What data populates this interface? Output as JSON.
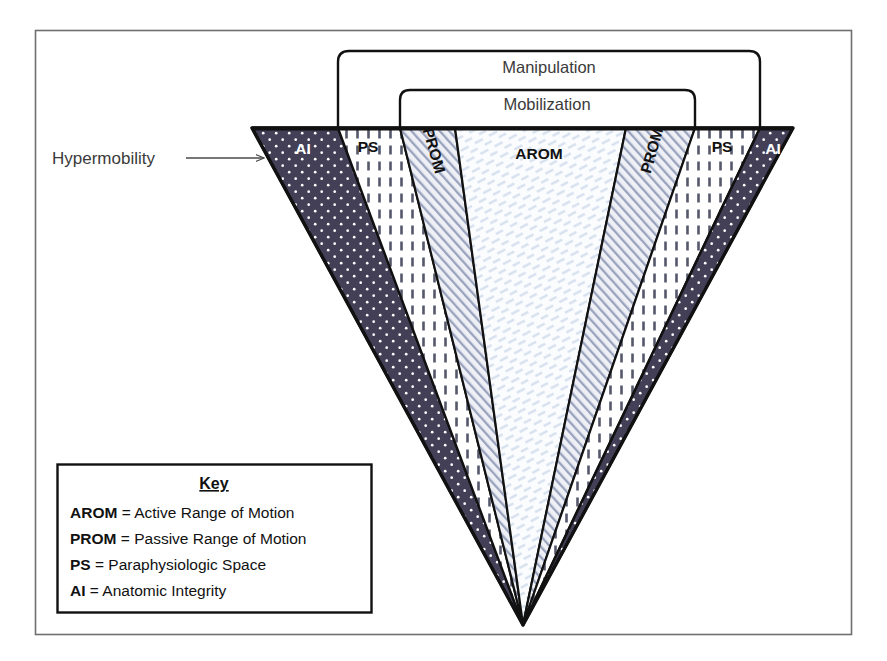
{
  "figure": {
    "title_text": "",
    "hypermobility_label": "Hypermobility",
    "brackets": [
      {
        "id": "manipulation",
        "label": "Manipulation"
      },
      {
        "id": "mobilization",
        "label": "Mobilization"
      }
    ],
    "bands": [
      {
        "id": "ai-left",
        "label": "AI",
        "side": "left",
        "fill": "#423f57",
        "text_color": "#ffffff"
      },
      {
        "id": "ps-left",
        "label": "PS",
        "side": "left",
        "fill": "#ffffff",
        "text_color": "#111111"
      },
      {
        "id": "prom-left",
        "label": "PROM",
        "side": "left",
        "fill": "#eef0f6",
        "text_color": "#111111"
      },
      {
        "id": "arom",
        "label": "AROM",
        "side": "center",
        "fill": "#f7f9fc",
        "text_color": "#111111"
      },
      {
        "id": "prom-right",
        "label": "PROM",
        "side": "right",
        "fill": "#eef0f6",
        "text_color": "#111111"
      },
      {
        "id": "ps-right",
        "label": "PS",
        "side": "right",
        "fill": "#ffffff",
        "text_color": "#111111"
      },
      {
        "id": "ai-right",
        "label": "AI",
        "side": "right",
        "fill": "#423f57",
        "text_color": "#ffffff"
      }
    ]
  },
  "key": {
    "title": "Key",
    "entries": [
      {
        "abbr": "AROM",
        "sep": " = ",
        "definition": "Active Range of Motion"
      },
      {
        "abbr": "PROM",
        "sep": " = ",
        "definition": "Passive Range of Motion"
      },
      {
        "abbr": "PS",
        "sep": " = ",
        "definition": "Paraphysiologic Space"
      },
      {
        "abbr": "AI",
        "sep": " = ",
        "definition": "Anatomic Integrity"
      }
    ]
  },
  "colors": {
    "frame_border": "#6e6e6e",
    "outline": "#111111",
    "ai_fill": "#423f57",
    "ai_dots": "#ffffff",
    "ps_fill": "#ffffff",
    "ps_dashes": "#55586b",
    "prom_fill": "#eef0f6",
    "prom_hatch": "#9aa3bd",
    "arom_fill": "#fbfcfe",
    "arom_hatch": "#c9d6ea",
    "text": "#111111",
    "label_text": "#3a3a3a"
  }
}
